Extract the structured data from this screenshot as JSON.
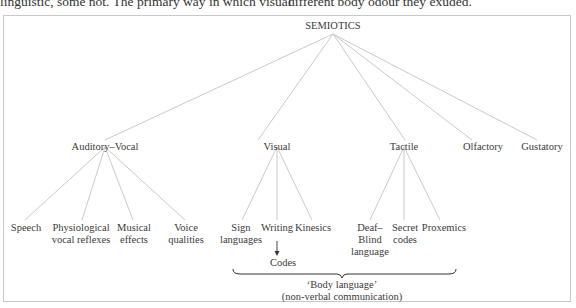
{
  "context_text": {
    "left": "linguistic, some not. The primary way in which visual",
    "right": "different body odour they exuded."
  },
  "diagram": {
    "root": "SEMIOTICS",
    "level1": [
      {
        "label": "Auditory–Vocal"
      },
      {
        "label": "Visual"
      },
      {
        "label": "Tactile"
      },
      {
        "label": "Olfactory"
      },
      {
        "label": "Gustatory"
      }
    ],
    "auditory_vocal_children": [
      {
        "line1": "Speech",
        "line2": ""
      },
      {
        "line1": "Physiological",
        "line2": "vocal reflexes"
      },
      {
        "line1": "Musical",
        "line2": "effects"
      },
      {
        "line1": "Voice",
        "line2": "qualities"
      }
    ],
    "visual_children": [
      {
        "line1": "Sign",
        "line2": "languages"
      },
      {
        "line1": "Writing",
        "line2": ""
      },
      {
        "line1": "Kinesics",
        "line2": ""
      }
    ],
    "tactile_children": [
      {
        "line1": "Deaf–",
        "line2": "Blind",
        "line3": "language"
      },
      {
        "line1": "Secret",
        "line2": "codes"
      },
      {
        "line1": "Proxemics",
        "line2": ""
      }
    ],
    "writing_arrow_target": "Codes",
    "brace_label": {
      "line1": "‘Body language’",
      "line2": "(non-verbal communication)"
    }
  }
}
